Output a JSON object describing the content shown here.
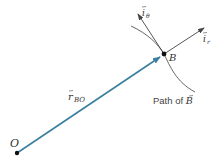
{
  "diagram": {
    "origin_label": "O",
    "point_label": "B",
    "position_vector_label": "r",
    "position_vector_subscript": "BO",
    "unit_theta_label": "i",
    "unit_theta_subscript": "θ",
    "unit_r_label": "i",
    "unit_r_subscript": "r",
    "path_label_prefix": "Path of ",
    "path_label_point": "B",
    "colors": {
      "position_vector": "#3a7fa0",
      "lines": "#444444",
      "points": "#111111"
    }
  }
}
